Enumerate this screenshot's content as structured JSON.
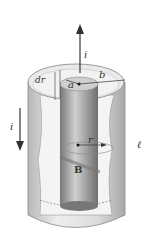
{
  "labels": {
    "current_top": "i",
    "current_left": "i",
    "dr": "dr",
    "a": "a",
    "b": "b",
    "r": "r",
    "B": "B",
    "length": "ℓ"
  },
  "colors": {
    "cylinder_light": "#e6e6e6",
    "cylinder_dark": "#9a9a9a",
    "rod": "#8c8c8c",
    "arrow": "#333333"
  }
}
